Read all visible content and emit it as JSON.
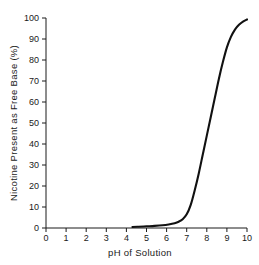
{
  "chart_data": {
    "type": "line",
    "title": "",
    "xlabel": "pH  of Solution",
    "ylabel": "Nicotine Present as Free Base (%)",
    "xlim": [
      0,
      10
    ],
    "ylim": [
      0,
      100
    ],
    "grid": false,
    "legend": null,
    "xticks": [
      "0",
      "1",
      "2",
      "3",
      "4",
      "5",
      "6",
      "7",
      "8",
      "9",
      "10"
    ],
    "yticks": [
      "0",
      "10",
      "20",
      "30",
      "40",
      "50",
      "60",
      "70",
      "80",
      "90",
      "100"
    ],
    "series": [
      {
        "name": "Nicotine free base fraction",
        "x": [
          4.3,
          4.6,
          5.0,
          5.4,
          5.8,
          6.1,
          6.4,
          6.6,
          6.8,
          7.0,
          7.2,
          7.4,
          7.6,
          7.8,
          8.0,
          8.2,
          8.4,
          8.6,
          8.8,
          9.0,
          9.2,
          9.4,
          9.6,
          9.8,
          10.0
        ],
        "values": [
          0.5,
          0.6,
          0.8,
          1.0,
          1.3,
          1.7,
          2.3,
          3.0,
          4.2,
          6.5,
          11.0,
          18.0,
          26.0,
          35.0,
          44.0,
          53.0,
          62.0,
          71.0,
          79.0,
          86.0,
          91.0,
          94.5,
          96.8,
          98.3,
          99.3
        ]
      }
    ],
    "colors": {
      "curve": "#111111",
      "axis": "#1a1a1a",
      "background": "#ffffff"
    }
  },
  "geometry": {
    "plot_left": 46,
    "plot_right": 247,
    "plot_top": 18,
    "plot_bottom": 228,
    "tick_len": 4
  }
}
